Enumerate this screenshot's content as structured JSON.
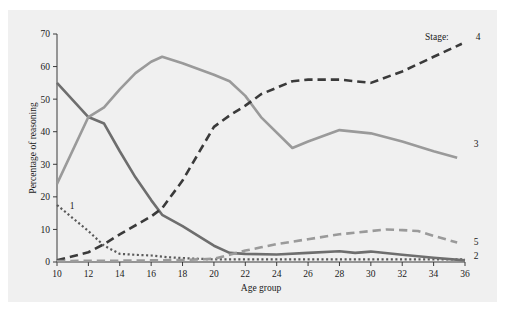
{
  "chart_data": {
    "type": "line",
    "title": "",
    "xlabel": "Age group",
    "ylabel": "Percentage of reasoning",
    "xlim": [
      10,
      36
    ],
    "ylim": [
      0,
      70
    ],
    "xticks": [
      10,
      12,
      14,
      16,
      18,
      20,
      22,
      24,
      26,
      28,
      30,
      32,
      34,
      36
    ],
    "yticks": [
      0,
      10,
      20,
      30,
      40,
      50,
      60,
      70
    ],
    "grid": false,
    "legend_position": "inline-right",
    "legend_title": "Stage:",
    "series": [
      {
        "name": "1",
        "label": "1",
        "color": "#5a5a5a",
        "style": "dotted",
        "x": [
          10,
          11,
          12,
          13,
          14,
          15,
          16,
          17,
          18,
          19,
          20,
          21,
          22,
          23,
          24,
          25,
          26,
          28,
          30,
          32,
          34,
          36
        ],
        "values": [
          17.5,
          13.5,
          9.5,
          5.0,
          2.5,
          2.2,
          2.0,
          1.5,
          1.2,
          1.0,
          0.8,
          0.8,
          0.8,
          0.8,
          0.8,
          0.8,
          0.8,
          0.8,
          0.8,
          0.8,
          0.8,
          0.8
        ]
      },
      {
        "name": "2",
        "label": "2",
        "color": "#6e6e6e",
        "style": "solid",
        "x": [
          10,
          12,
          13,
          14,
          15,
          16,
          16.7,
          18,
          20,
          21,
          22,
          24,
          26,
          28,
          29,
          30,
          32,
          34,
          36
        ],
        "values": [
          55.0,
          44.5,
          42.5,
          34.0,
          26.0,
          19.0,
          14.5,
          11.0,
          5.0,
          2.8,
          2.5,
          2.3,
          2.8,
          3.3,
          2.8,
          3.2,
          2.2,
          1.3,
          0.5
        ]
      },
      {
        "name": "3",
        "label": "3",
        "color": "#9a9a9a",
        "style": "solid",
        "x": [
          10,
          12,
          13,
          14,
          15,
          16,
          16.7,
          18,
          20,
          21,
          22,
          23,
          25,
          26,
          28,
          30,
          32,
          34,
          35.5
        ],
        "values": [
          24.0,
          44.5,
          47.5,
          53.0,
          58.0,
          61.5,
          63.0,
          61.0,
          57.5,
          55.5,
          51.0,
          44.5,
          35.0,
          37.0,
          40.5,
          39.5,
          37.0,
          34.0,
          32.0
        ]
      },
      {
        "name": "4",
        "label": "4",
        "color": "#3a3a3a",
        "style": "dashed",
        "x": [
          10,
          12,
          13,
          14,
          16,
          16.7,
          18,
          20,
          21,
          22,
          23,
          25,
          26,
          28,
          30,
          32,
          34,
          35.8
        ],
        "values": [
          0.5,
          3.0,
          5.5,
          8.5,
          14.0,
          16.5,
          25.0,
          41.5,
          45.0,
          48.0,
          51.5,
          55.5,
          56.0,
          56.0,
          55.0,
          58.5,
          63.0,
          67.0
        ]
      },
      {
        "name": "5",
        "label": "5",
        "color": "#9a9a9a",
        "style": "dashed",
        "x": [
          10,
          14,
          16,
          18,
          20,
          21,
          22,
          23,
          24,
          26,
          28,
          30,
          31,
          32,
          33,
          34,
          35.5
        ],
        "values": [
          0.3,
          0.4,
          0.5,
          0.6,
          1.0,
          2.2,
          3.5,
          4.5,
          5.5,
          7.0,
          8.5,
          9.5,
          10.0,
          9.8,
          9.5,
          8.0,
          6.0
        ]
      }
    ]
  },
  "axis": {
    "y_title": "Percentage of reasoning",
    "x_title": "Age group",
    "y_tick_labels": [
      "70",
      "60",
      "50",
      "40",
      "30",
      "20",
      "10",
      "0"
    ],
    "x_tick_labels": [
      "10",
      "12",
      "14",
      "16",
      "18",
      "20",
      "22",
      "24",
      "26",
      "28",
      "30",
      "32",
      "34",
      "36"
    ]
  },
  "annotations": {
    "stage_title": "Stage:",
    "label_1": "1",
    "label_2": "2",
    "label_3": "3",
    "label_4": "4",
    "label_5": "5"
  },
  "colors": {
    "figure_background": "#f0f0f0",
    "page_background": "#ffffff",
    "axis": "#3a3a3a",
    "series_1": "#5a5a5a",
    "series_2": "#6e6e6e",
    "series_3": "#9a9a9a",
    "series_4": "#3a3a3a",
    "series_5": "#9a9a9a"
  }
}
